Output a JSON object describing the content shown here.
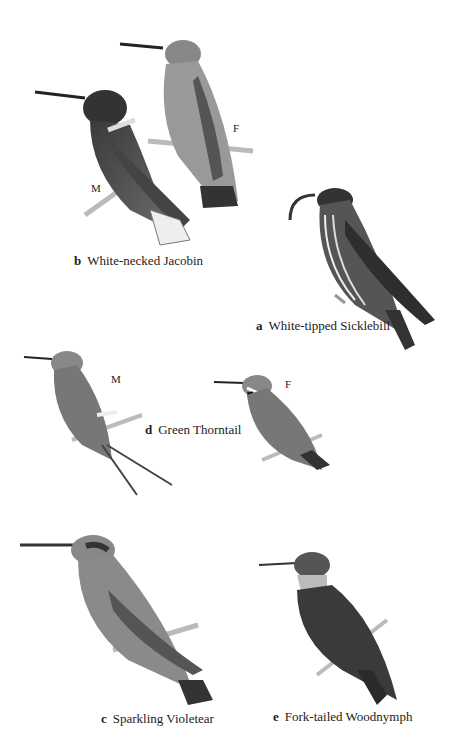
{
  "plate": {
    "species": [
      {
        "letter": "b",
        "name": "White-necked Jacobin",
        "sex_labels": [
          "M",
          "F"
        ]
      },
      {
        "letter": "a",
        "name": "White-tipped Sicklebill"
      },
      {
        "letter": "d",
        "name": "Green Thorntail",
        "sex_labels": [
          "M",
          "F"
        ]
      },
      {
        "letter": "c",
        "name": "Sparkling Violetear"
      },
      {
        "letter": "e",
        "name": "Fork-tailed Woodnymph"
      }
    ]
  },
  "colors": {
    "background": "#ffffff",
    "ink": "#222222"
  }
}
